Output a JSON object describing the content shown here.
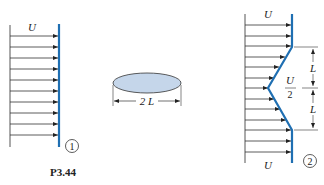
{
  "figure": {
    "caption": "P3.44",
    "panel1": {
      "velocity_label": "U",
      "station_label": "1"
    },
    "body": {
      "width_label": "2 L",
      "shape": "ellipse",
      "fill_color": "#c5d6ea"
    },
    "panel2": {
      "top_velocity_label": "U",
      "bottom_velocity_label": "U",
      "defect_label_num": "U",
      "defect_label_den": "2",
      "upper_length_label": "L",
      "lower_length_label": "L",
      "station_label": "2"
    },
    "colors": {
      "profile": "#1f6fb2",
      "arrows": "#333333"
    }
  }
}
